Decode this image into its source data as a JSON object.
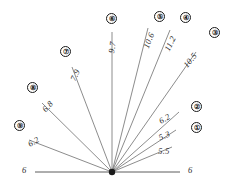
{
  "diagram": {
    "type": "radial-fan-angle-diagram",
    "vertex": {
      "x": 112,
      "y": 172
    },
    "baseline": {
      "x1": 35,
      "x2": 180,
      "y": 172,
      "left_label": "6",
      "right_label": "6"
    },
    "rays": [
      {
        "index": "5",
        "value": "5.5",
        "line": {
          "x2": 172,
          "y2": 147
        },
        "value_pos": {
          "x": 158,
          "y": 146
        },
        "value_rotation": -2,
        "has_badge": false
      },
      {
        "index": "1",
        "value": "5.3",
        "badge": "①",
        "line": {
          "x2": 176,
          "y2": 130
        },
        "value_pos": {
          "x": 157,
          "y": 133
        },
        "value_rotation": -22,
        "badge_pos": {
          "x": 191,
          "y": 122
        },
        "has_badge": true
      },
      {
        "index": "2",
        "value": "6.2",
        "badge": "②",
        "line": {
          "x2": 179,
          "y2": 112
        },
        "value_pos": {
          "x": 157,
          "y": 117
        },
        "value_rotation": -30,
        "badge_pos": {
          "x": 191,
          "y": 101
        },
        "has_badge": true
      },
      {
        "index": "3",
        "value": "10.5",
        "badge": "③",
        "line": {
          "x2": 196,
          "y2": 52
        },
        "value_pos": {
          "x": 181,
          "y": 63
        },
        "value_rotation": -50,
        "badge_pos": {
          "x": 209,
          "y": 27
        },
        "has_badge": true
      },
      {
        "index": "4",
        "value": "11.2",
        "badge": "④",
        "line": {
          "x2": 170,
          "y2": 30
        },
        "value_pos": {
          "x": 162,
          "y": 48
        },
        "value_rotation": -63,
        "badge_pos": {
          "x": 180,
          "y": 12
        },
        "has_badge": true
      },
      {
        "index": "5b",
        "value": "10.6",
        "badge": "⑤",
        "line": {
          "x2": 148,
          "y2": 28
        },
        "value_pos": {
          "x": 141,
          "y": 46
        },
        "value_rotation": -68,
        "badge_pos": {
          "x": 154,
          "y": 11
        },
        "has_badge": true
      },
      {
        "index": "6",
        "value": "9.7",
        "badge": "⑥",
        "line": {
          "x2": 112,
          "y2": 32
        },
        "value_pos": {
          "x": 106,
          "y": 52
        },
        "value_rotation": -80,
        "badge_pos": {
          "x": 106,
          "y": 13
        },
        "has_badge": true
      },
      {
        "index": "7",
        "value": "7.9",
        "badge": "⑦",
        "line": {
          "x2": 72,
          "y2": 67
        },
        "value_pos": {
          "x": 68,
          "y": 78
        },
        "value_rotation": -65,
        "badge_pos": {
          "x": 60,
          "y": 46
        },
        "has_badge": true
      },
      {
        "index": "8",
        "value": "6.8",
        "badge": "⑧",
        "line": {
          "x2": 42,
          "y2": 103
        },
        "value_pos": {
          "x": 40,
          "y": 107
        },
        "value_rotation": -47,
        "badge_pos": {
          "x": 27,
          "y": 82
        },
        "has_badge": true
      },
      {
        "index": "9",
        "value": "6.2",
        "badge": "⑨",
        "line": {
          "x2": 29,
          "y2": 140
        },
        "value_pos": {
          "x": 26,
          "y": 140
        },
        "value_rotation": -30,
        "badge_pos": {
          "x": 14,
          "y": 120
        },
        "has_badge": true
      }
    ]
  }
}
